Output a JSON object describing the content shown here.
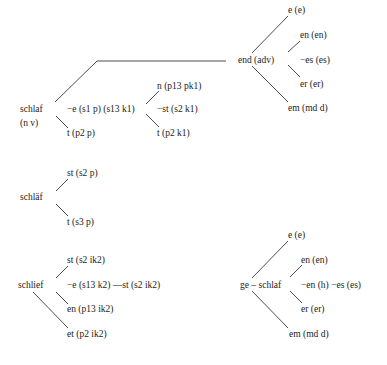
{
  "diagram": {
    "title": "",
    "colors": {
      "text": "#222222",
      "edge": "#3a3a3a",
      "background": "#ffffff"
    },
    "groups": {
      "schlaf": {
        "root": "schlaf",
        "root_pos": "(n v)",
        "e_branch": "−e (s1 p) (s13 k1)",
        "e_children": [
          "n (p13 pk1)",
          "−st (s2 k1)",
          "t (p2 k1)"
        ],
        "t_branch": "t (p2 p)",
        "end": {
          "label": "end (adv)",
          "children": [
            "e (e)",
            "en (en)",
            "−es (es)",
            "er (er)",
            "em (md d)"
          ]
        }
      },
      "schlaef": {
        "root": "schläf",
        "children": [
          "st (s2 p)",
          "t (s3 p)"
        ]
      },
      "schlief": {
        "root": "schlief",
        "children": [
          "st (s2 ik2)",
          "−e (s13 k2) —st (s2 ik2)",
          "en (p13 ik2)",
          "et (p2 ik2)"
        ]
      },
      "geschlaf": {
        "root": "ge – schlaf",
        "children": [
          "e (e)",
          "en (en)",
          "−en (h) −es (es)",
          "er (er)",
          "em (md d)"
        ]
      }
    }
  }
}
